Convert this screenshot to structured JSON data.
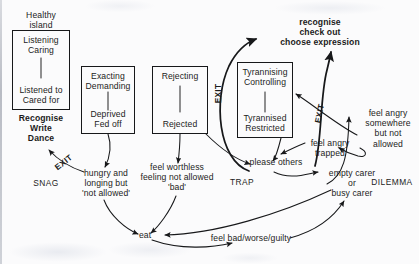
{
  "diagram": {
    "boxes": [
      {
        "name": "healthy-island",
        "caption": "Healthy\nisland",
        "top": "Listening\nCaring",
        "bottom": "Listened to\nCared for"
      },
      {
        "name": "exacting",
        "caption": "",
        "top": "Exacting\nDemanding",
        "bottom": "Deprived\nFed off"
      },
      {
        "name": "rejecting",
        "caption": "",
        "top": "Rejecting",
        "bottom": "Rejected"
      },
      {
        "name": "tyrannising",
        "caption": "",
        "top": "Tyrannising\nControlling",
        "bottom": "Tyrannised\nRestricted"
      }
    ],
    "labels": {
      "healthy_island": "Healthy\nisland",
      "recognise_write_dance": "Recognise\nWrite\nDance",
      "recognise_check_out": "recognise\ncheck out\nchoose expression",
      "hungry_longing": "hungry and\nlonging but\n'not allowed'",
      "feel_worthless": "feel worthless\nfeeling not allowed\n'bad'",
      "please_others": "please others",
      "feel_angry_trapped": "feel angry\ntrapped",
      "feel_angry_somewhere": "feel angry\nsomewhere\nbut not\nallowed",
      "empty_busy_carer": "empty carer\nor\nbusy carer",
      "eat": "eat",
      "feel_bad_worse_guilty": "feel bad/worse/guilty"
    },
    "captions": {
      "snag": "SNAG",
      "trap": "TRAP",
      "dilemma": "DILEMMA"
    },
    "exits": {
      "exit_snag": "EXIT",
      "exit_left": "EXIT",
      "exit_right": "EXIT"
    },
    "colors": {
      "ink": "#17181a",
      "paper": "#fbfbfc"
    }
  }
}
